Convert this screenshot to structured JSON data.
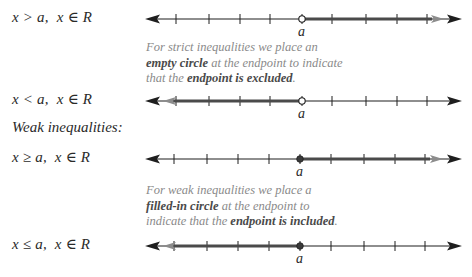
{
  "rows": [
    {
      "inequality": "x > a,",
      "domain": "x ∈ R",
      "direction": "right",
      "endpoint": "open"
    },
    {
      "inequality": "x < a,",
      "domain": "x ∈ R",
      "direction": "left",
      "endpoint": "open"
    },
    {
      "inequality": "x ≥ a,",
      "domain": "x ∈ R",
      "direction": "right",
      "endpoint": "closed"
    },
    {
      "inequality": "x ≤ a,",
      "domain": "x ∈ R",
      "direction": "left",
      "endpoint": "closed"
    }
  ],
  "heading_weak": "Weak inequalities:",
  "endpoint_label": "a",
  "note_strict": {
    "line1": "For strict inequalities we place an",
    "line2_bold": "empty circle",
    "line2_rest": " at the endpoint to indicate",
    "line3_pre": "that the ",
    "line3_bold": "endpoint is excluded",
    "line3_post": "."
  },
  "note_weak": {
    "line1": "For weak inequalities we place a",
    "line2_bold": "filled-in circle",
    "line2_rest": " at the endpoint to",
    "line3_pre": "indicate that the ",
    "line3_bold": "endpoint is included",
    "line3_post": "."
  },
  "colors": {
    "axis": "#1e1e1e",
    "ray": "#4a4a4a",
    "ray_arrow": "#8c8c8c",
    "note_text": "#8a8a8a"
  }
}
